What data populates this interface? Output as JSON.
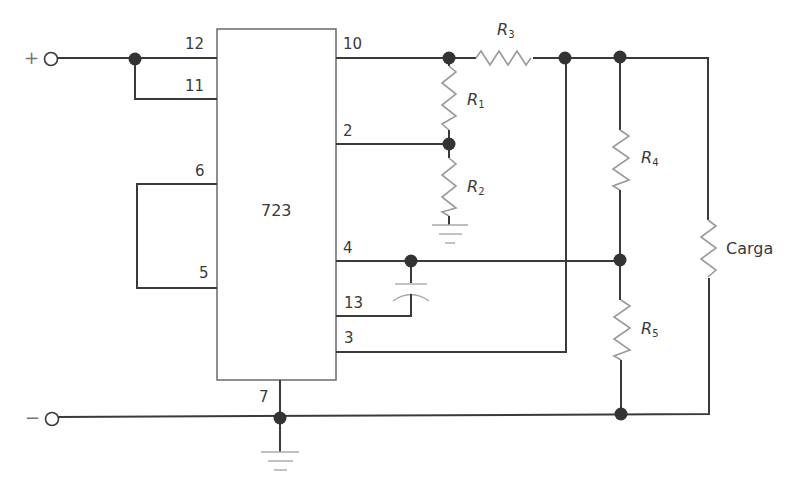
{
  "diagram": {
    "title": "",
    "type": "circuit schematic",
    "ic": {
      "label": "723"
    },
    "terminals": {
      "positive": "+",
      "negative": "−"
    },
    "pins": {
      "p12": "12",
      "p11": "11",
      "p6": "6",
      "p5": "5",
      "p10": "10",
      "p2": "2",
      "p4": "4",
      "p13": "13",
      "p3": "3",
      "p7": "7"
    },
    "resistors": [
      {
        "id": "R1",
        "letter": "R",
        "sub": "1"
      },
      {
        "id": "R2",
        "letter": "R",
        "sub": "2"
      },
      {
        "id": "R3",
        "letter": "R",
        "sub": "3"
      },
      {
        "id": "R4",
        "letter": "R",
        "sub": "4"
      },
      {
        "id": "R5",
        "letter": "R",
        "sub": "5"
      }
    ],
    "load": {
      "label": "Carga"
    },
    "colors": {
      "wire": "#3a3a3a",
      "component": "#9a9a9a",
      "node": "#333333",
      "background": "#ffffff"
    }
  }
}
